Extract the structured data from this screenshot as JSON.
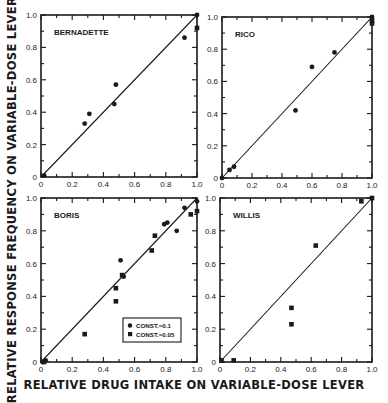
{
  "figure": {
    "ylabel": "RELATIVE RESPONSE FREQUENCY ON VARIABLE-DOSE LEVER",
    "xlabel": "RELATIVE DRUG INTAKE ON VARIABLE-DOSE LEVER"
  },
  "chart_data": [
    {
      "type": "scatter",
      "title": "BERNADETTE",
      "xlabel": "RELATIVE DRUG INTAKE ON VARIABLE-DOSE LEVER",
      "ylabel": "RELATIVE RESPONSE FREQUENCY ON VARIABLE-DOSE LEVER",
      "xlim": [
        0,
        1.0
      ],
      "ylim": [
        0,
        1.0
      ],
      "xticks": [
        "0",
        "0.2",
        "0.4",
        "0.6",
        "0.8",
        "1.0"
      ],
      "yticks": [
        "0",
        "0.2",
        "0.4",
        "0.6",
        "0.8",
        "1.0"
      ],
      "reference_line": [
        [
          0,
          0
        ],
        [
          1,
          1
        ]
      ],
      "grid": false,
      "series": [
        {
          "name": "CONST.=0.1",
          "marker": "circle",
          "points": [
            [
              0.02,
              0.01
            ],
            [
              0.28,
              0.33
            ],
            [
              0.31,
              0.39
            ],
            [
              0.47,
              0.45
            ],
            [
              0.48,
              0.57
            ],
            [
              0.92,
              0.86
            ],
            [
              1.0,
              1.0
            ]
          ]
        },
        {
          "name": "CONST.=0.05",
          "marker": "square",
          "points": [
            [
              1.0,
              0.92
            ]
          ]
        }
      ]
    },
    {
      "type": "scatter",
      "title": "RICO",
      "xlim": [
        0,
        1.0
      ],
      "ylim": [
        0,
        1.0
      ],
      "xticks": [
        "0",
        "0.2",
        "0.4",
        "0.6",
        "0.8",
        "1.0"
      ],
      "yticks": [
        "0",
        "0.2",
        "0.4",
        "0.6",
        "0.8",
        "1.0"
      ],
      "reference_line": [
        [
          0,
          0
        ],
        [
          1,
          1
        ]
      ],
      "grid": false,
      "series": [
        {
          "name": "CONST.=0.1",
          "marker": "circle",
          "points": [
            [
              0.0,
              0.0
            ],
            [
              0.05,
              0.05
            ],
            [
              0.08,
              0.07
            ],
            [
              0.49,
              0.42
            ],
            [
              0.6,
              0.69
            ],
            [
              0.75,
              0.78
            ],
            [
              1.0,
              1.0
            ]
          ]
        },
        {
          "name": "CONST.=0.05",
          "marker": "square",
          "points": [
            [
              1.0,
              0.98
            ],
            [
              1.0,
              0.96
            ]
          ]
        }
      ]
    },
    {
      "type": "scatter",
      "title": "BORIS",
      "xlim": [
        0,
        1.0
      ],
      "ylim": [
        0,
        1.0
      ],
      "xticks": [
        "0",
        "0.2",
        "0.4",
        "0.6",
        "0.8",
        "1.0"
      ],
      "yticks": [
        "0",
        "0.2",
        "0.4",
        "0.6",
        "0.8",
        "1.0"
      ],
      "reference_line": [
        [
          0,
          0
        ],
        [
          1,
          1
        ]
      ],
      "legend": {
        "position": "lower right",
        "entries": [
          "CONST.=0.1",
          "CONST.=0.05"
        ]
      },
      "grid": false,
      "series": [
        {
          "name": "CONST.=0.1",
          "marker": "circle",
          "points": [
            [
              0.01,
              0.0
            ],
            [
              0.03,
              0.01
            ],
            [
              0.51,
              0.62
            ],
            [
              0.53,
              0.52
            ],
            [
              0.79,
              0.84
            ],
            [
              0.81,
              0.85
            ],
            [
              0.87,
              0.8
            ],
            [
              0.92,
              0.94
            ],
            [
              1.0,
              0.98
            ]
          ]
        },
        {
          "name": "CONST.=0.05",
          "marker": "square",
          "points": [
            [
              0.02,
              0.0
            ],
            [
              0.28,
              0.17
            ],
            [
              0.48,
              0.45
            ],
            [
              0.48,
              0.37
            ],
            [
              0.52,
              0.53
            ],
            [
              0.71,
              0.68
            ],
            [
              0.73,
              0.77
            ],
            [
              0.96,
              0.9
            ],
            [
              1.0,
              0.92
            ]
          ]
        }
      ]
    },
    {
      "type": "scatter",
      "title": "WILLIS",
      "xlim": [
        0,
        1.0
      ],
      "ylim": [
        0,
        1.0
      ],
      "xticks": [
        "0",
        "0.2",
        "0.4",
        "0.6",
        "0.8",
        "1.0"
      ],
      "yticks": [
        "0",
        "0.2",
        "0.4",
        "0.6",
        "0.8",
        "1.0"
      ],
      "reference_line": [
        [
          0,
          0
        ],
        [
          1,
          1
        ]
      ],
      "grid": false,
      "series": [
        {
          "name": "CONST.=0.05",
          "marker": "square",
          "points": [
            [
              0.01,
              0.01
            ],
            [
              0.09,
              0.01
            ],
            [
              0.47,
              0.33
            ],
            [
              0.47,
              0.23
            ],
            [
              0.63,
              0.71
            ],
            [
              0.93,
              0.98
            ],
            [
              1.0,
              1.0
            ]
          ]
        }
      ]
    }
  ]
}
